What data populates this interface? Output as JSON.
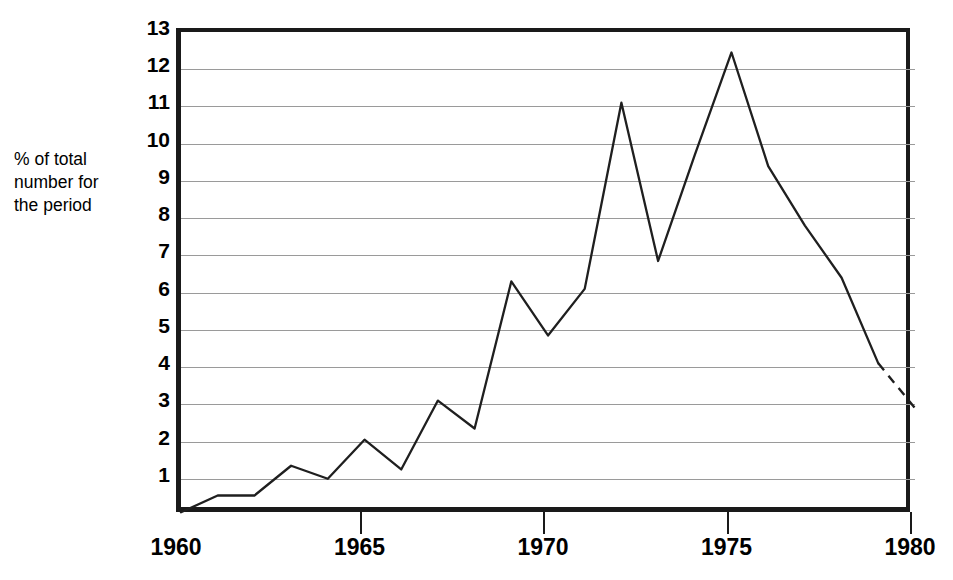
{
  "chart_data": {
    "type": "line",
    "title": "",
    "xlabel": "",
    "ylabel": "% of total number for the period",
    "ylabel_lines": "% of total\nnumber for\nthe period",
    "x": [
      1960,
      1961,
      1962,
      1963,
      1964,
      1965,
      1966,
      1967,
      1968,
      1969,
      1970,
      1971,
      1972,
      1973,
      1974,
      1975,
      1976,
      1977,
      1978,
      1979,
      1980
    ],
    "values": [
      0.1,
      0.55,
      0.55,
      1.35,
      1.0,
      2.05,
      1.25,
      3.1,
      2.35,
      6.3,
      4.85,
      6.1,
      11.1,
      6.85,
      9.7,
      12.45,
      9.4,
      7.8,
      6.4,
      4.1,
      2.9
    ],
    "series": [
      {
        "name": "% of total number for the period",
        "style": "solid",
        "x": [
          1960,
          1961,
          1962,
          1963,
          1964,
          1965,
          1966,
          1967,
          1968,
          1969,
          1970,
          1971,
          1972,
          1973,
          1974,
          1975,
          1976,
          1977,
          1978,
          1979
        ],
        "values": [
          0.1,
          0.55,
          0.55,
          1.35,
          1.0,
          2.05,
          1.25,
          3.1,
          2.35,
          6.3,
          4.85,
          6.1,
          11.1,
          6.85,
          9.7,
          12.45,
          9.4,
          7.8,
          6.4,
          4.1
        ]
      },
      {
        "name": "projected",
        "style": "dashed",
        "x": [
          1979,
          1980
        ],
        "values": [
          4.1,
          2.9
        ]
      }
    ],
    "xlim": [
      1960,
      1980
    ],
    "ylim": [
      0,
      13
    ],
    "x_ticks": [
      1960,
      1965,
      1970,
      1975,
      1980
    ],
    "x_tick_labels": [
      "1960",
      "1965",
      "1970",
      "1975",
      "1980"
    ],
    "y_ticks": [
      1,
      2,
      3,
      4,
      5,
      6,
      7,
      8,
      9,
      10,
      11,
      12,
      13
    ],
    "y_tick_labels": [
      "1",
      "2",
      "3",
      "4",
      "5",
      "6",
      "7",
      "8",
      "9",
      "10",
      "11",
      "12",
      "13"
    ],
    "grid": "horizontal",
    "legend": "none",
    "line_color": "#1f1f1f",
    "grid_color": "#9a9a9a",
    "frame_color": "#1a1a1a",
    "background": "#ffffff"
  }
}
